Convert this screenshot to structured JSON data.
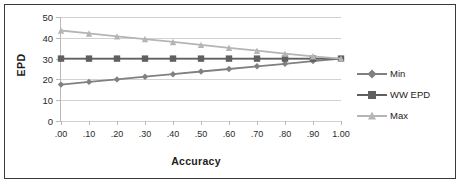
{
  "chart_data": {
    "type": "line",
    "title": "",
    "xlabel": "Accuracy",
    "ylabel": "EPD",
    "xlim": [
      0,
      1
    ],
    "ylim": [
      0,
      50
    ],
    "grid": true,
    "legend_position": "right",
    "x": [
      0.0,
      0.1,
      0.2,
      0.3,
      0.4,
      0.5,
      0.6,
      0.7,
      0.8,
      0.9,
      1.0
    ],
    "xticklabels": [
      ".00",
      ".10",
      ".20",
      ".30",
      ".40",
      ".50",
      ".60",
      ".70",
      ".80",
      ".90",
      "1.00"
    ],
    "yticks": [
      0,
      10,
      20,
      30,
      40,
      50
    ],
    "yticklabels": [
      "0",
      "10",
      "20",
      "30",
      "40",
      "50"
    ],
    "series": [
      {
        "name": "Min",
        "color": "#808080",
        "marker": "diamond",
        "values": [
          17.5,
          18.8,
          20.0,
          21.3,
          22.5,
          23.8,
          25.0,
          26.3,
          27.5,
          28.8,
          30.0
        ]
      },
      {
        "name": "WW EPD",
        "color": "#606060",
        "marker": "square",
        "values": [
          30.0,
          30.0,
          30.0,
          30.0,
          30.0,
          30.0,
          30.0,
          30.0,
          30.0,
          30.0,
          30.0
        ]
      },
      {
        "name": "Max",
        "color": "#b5b5b5",
        "marker": "triangle",
        "values": [
          43.5,
          42.1,
          40.7,
          39.4,
          38.0,
          36.6,
          35.2,
          33.8,
          32.4,
          31.1,
          30.0
        ]
      }
    ]
  },
  "legend": {
    "items": [
      {
        "label": "Min"
      },
      {
        "label": "WW EPD"
      },
      {
        "label": "Max"
      }
    ]
  }
}
